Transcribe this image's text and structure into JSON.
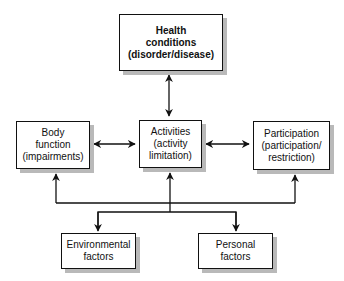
{
  "diagram": {
    "nodes": {
      "health": {
        "label": "Health\nconditions\n(disorder/disease)"
      },
      "body": {
        "label": "Body\nfunction\n(impairments)"
      },
      "activities": {
        "label": "Activities\n(activity\nlimitation)"
      },
      "participation": {
        "label": "Participation\n(participation/\nrestriction)"
      },
      "environmental": {
        "label": "Environmental\nfactors"
      },
      "personal": {
        "label": "Personal\nfactors"
      }
    },
    "edges": [
      {
        "from": "health",
        "to": "activities",
        "type": "bidirectional"
      },
      {
        "from": "body",
        "to": "activities",
        "type": "bidirectional"
      },
      {
        "from": "activities",
        "to": "participation",
        "type": "bidirectional"
      },
      {
        "from": "contextual-factors-bus",
        "to": "body",
        "type": "directed"
      },
      {
        "from": "contextual-factors-bus",
        "to": "activities",
        "type": "directed"
      },
      {
        "from": "contextual-factors-bus",
        "to": "participation",
        "type": "directed"
      },
      {
        "from": "contextual-factors-bus",
        "to": "environmental",
        "type": "directed"
      },
      {
        "from": "contextual-factors-bus",
        "to": "personal",
        "type": "directed"
      }
    ]
  }
}
